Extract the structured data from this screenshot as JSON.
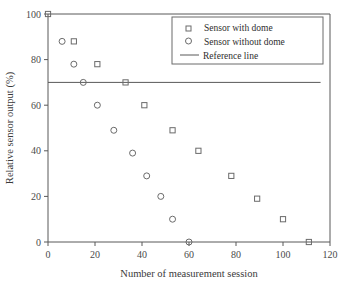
{
  "chart_data": {
    "type": "scatter",
    "title": "",
    "xlabel": "Number of measurement session",
    "ylabel": "Relative sensor output (%)",
    "xlim": [
      0,
      120
    ],
    "ylim": [
      0,
      100
    ],
    "xticks": [
      0,
      20,
      40,
      60,
      80,
      100,
      120
    ],
    "yticks": [
      0,
      20,
      40,
      60,
      80,
      100
    ],
    "grid": false,
    "legend_position": "top-right",
    "series": [
      {
        "name": "Sensor with dome",
        "marker": "square",
        "points": [
          {
            "x": 0,
            "y": 100
          },
          {
            "x": 11,
            "y": 88
          },
          {
            "x": 21,
            "y": 78
          },
          {
            "x": 33,
            "y": 70
          },
          {
            "x": 41,
            "y": 60
          },
          {
            "x": 53,
            "y": 49
          },
          {
            "x": 64,
            "y": 40
          },
          {
            "x": 78,
            "y": 29
          },
          {
            "x": 89,
            "y": 19
          },
          {
            "x": 100,
            "y": 10
          },
          {
            "x": 111,
            "y": 0
          }
        ]
      },
      {
        "name": "Sensor without dome",
        "marker": "circle",
        "points": [
          {
            "x": 6,
            "y": 88
          },
          {
            "x": 11,
            "y": 78
          },
          {
            "x": 15,
            "y": 70
          },
          {
            "x": 21,
            "y": 60
          },
          {
            "x": 28,
            "y": 49
          },
          {
            "x": 36,
            "y": 39
          },
          {
            "x": 42,
            "y": 29
          },
          {
            "x": 48,
            "y": 20
          },
          {
            "x": 53,
            "y": 10
          },
          {
            "x": 60,
            "y": 0
          }
        ]
      }
    ],
    "reference_line": {
      "name": "Reference line",
      "orientation": "horizontal",
      "y": 70,
      "x_start": 0,
      "x_end": 116
    },
    "legend": [
      {
        "label": "Sensor with dome",
        "marker": "square"
      },
      {
        "label": "Sensor without dome",
        "marker": "circle"
      },
      {
        "label": "Reference line",
        "marker": "line"
      }
    ]
  },
  "colors": {
    "axis": "#595959",
    "marker": "#6b6b6b",
    "text": "#2e2e2e",
    "background": "#ffffff"
  }
}
